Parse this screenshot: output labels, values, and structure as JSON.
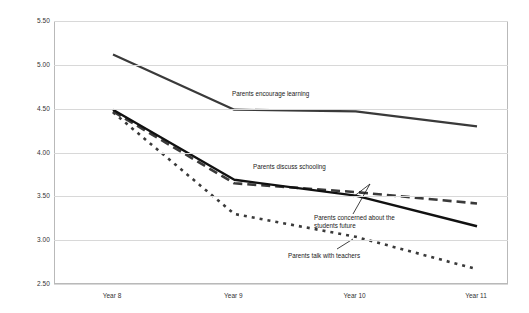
{
  "chart_data": {
    "type": "line",
    "title": "",
    "xlabel": "",
    "ylabel": "Attitude Score",
    "categories": [
      "Year 8",
      "Year 9",
      "Year 10",
      "Year 11"
    ],
    "ylim": [
      2.5,
      5.5
    ],
    "ytick_labels": [
      "5.50",
      "5.00",
      "4.50",
      "4.00",
      "3.50",
      "3.00",
      "2.50"
    ],
    "ytick_values": [
      5.5,
      5.0,
      4.5,
      4.0,
      3.5,
      3.0,
      2.5
    ],
    "grid": true,
    "legend_position": "inline-annotations",
    "series": [
      {
        "name": "Parents encourage learning",
        "style": "solid",
        "color": "#3a3a3a",
        "values": [
          5.13,
          4.5,
          4.48,
          4.31
        ]
      },
      {
        "name": "Parents discuss schooling",
        "style": "dashed",
        "color": "#3a3a3a",
        "values": [
          4.48,
          3.66,
          3.56,
          3.43
        ]
      },
      {
        "name": "Parents concerned about the students future",
        "style": "solid",
        "color": "#111111",
        "values": [
          4.5,
          3.7,
          3.52,
          3.17
        ]
      },
      {
        "name": "Parents talk with teachers",
        "style": "dotted",
        "color": "#3a3a3a",
        "values": [
          4.47,
          3.31,
          3.05,
          2.68
        ]
      }
    ],
    "annotations": [
      {
        "text": "Parents encourage learning",
        "x": 232,
        "y": 90
      },
      {
        "text": "Parents discuss schooling",
        "x": 253,
        "y": 163
      },
      {
        "text": "Parents concerned about the",
        "x": 314,
        "y": 214
      },
      {
        "text": "students future",
        "x": 314,
        "y": 222
      },
      {
        "text": "Parents talk with teachers",
        "x": 288,
        "y": 252
      }
    ]
  },
  "colors": {
    "grid": "#d8d8d8",
    "frame": "#b9b9b9",
    "text": "#333333",
    "series_dark": "#111111",
    "series_gray": "#3a3a3a",
    "background": "#ffffff"
  }
}
